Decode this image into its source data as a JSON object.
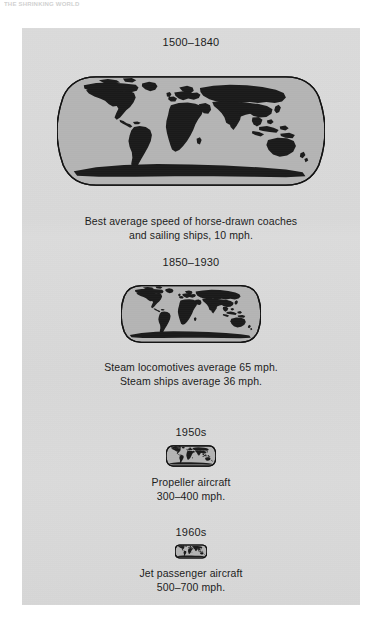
{
  "page": {
    "running_head": "THE SHRINKING WORLD",
    "panel_background": "#d9d9d9",
    "ocean_color": "#b4b4b4",
    "land_color": "#1a1a1a",
    "outline_color": "#111111",
    "text_color": "#1b1b1b"
  },
  "figure": {
    "sections": [
      {
        "id": "section-1",
        "era": "1500–1840",
        "map_name": "world-map-large",
        "caption": "Best average speed of horse-drawn coaches\nand sailing ships, 10 mph.",
        "speed_mph": "10"
      },
      {
        "id": "section-2",
        "era": "1850–1930",
        "map_name": "world-map-medium",
        "caption": "Steam locomotives average 65 mph.\nSteam ships average 36 mph.",
        "speed_mph": "65 / 36"
      },
      {
        "id": "section-3",
        "era": "1950s",
        "map_name": "world-map-small",
        "caption": "Propeller aircraft\n300–400 mph.",
        "speed_mph": "300–400"
      },
      {
        "id": "section-4",
        "era": "1960s",
        "map_name": "world-map-tiny",
        "caption": "Jet passenger aircraft\n500–700 mph.",
        "speed_mph": "500–700"
      }
    ]
  }
}
